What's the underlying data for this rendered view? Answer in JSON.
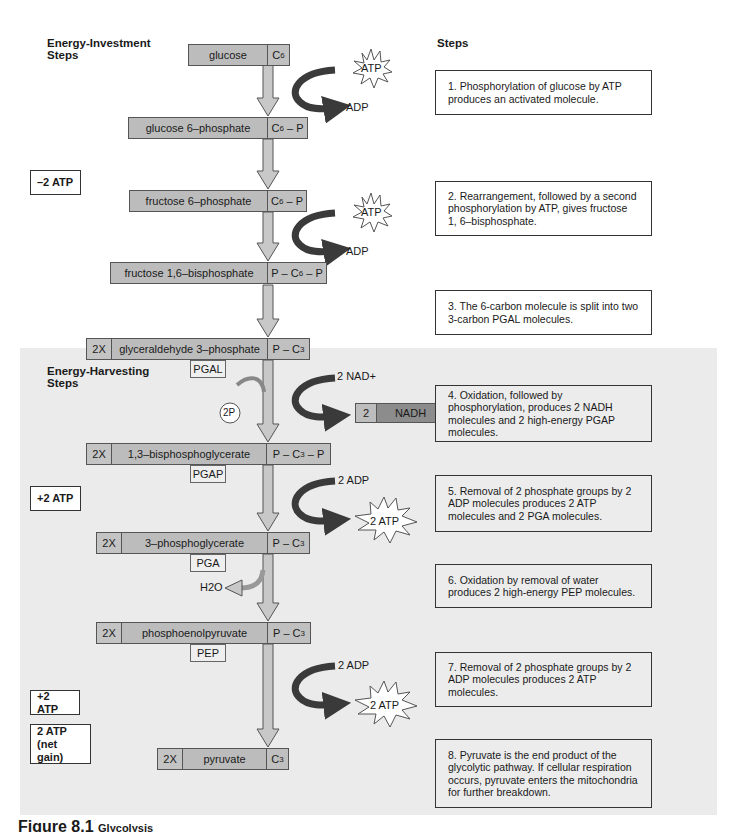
{
  "sections": {
    "investment_title": "Energy-Investment Steps",
    "harvesting_title": "Energy-Harvesting Steps",
    "steps_header": "Steps"
  },
  "atp_tallies": [
    {
      "label": "–2 ATP"
    },
    {
      "label": "+2 ATP"
    },
    {
      "label": "+2 ATP"
    },
    {
      "label": "2 ATP",
      "sub": "(net gain)"
    }
  ],
  "molecules": [
    {
      "name": "glucose",
      "formula": "C6",
      "multiplier": ""
    },
    {
      "name": "glucose 6–phosphate",
      "formula": "C6 – P",
      "multiplier": ""
    },
    {
      "name": "fructose 6–phosphate",
      "formula": "C6 – P",
      "multiplier": ""
    },
    {
      "name": "fructose 1,6–bisphosphate",
      "formula": "P – C6 – P",
      "multiplier": ""
    },
    {
      "name": "glyceraldehyde 3–phosphate",
      "formula": "P – C3",
      "multiplier": "2X",
      "abbr": "PGAL"
    },
    {
      "name": "1,3–bisphosphoglycerate",
      "formula": "P – C3 – P",
      "multiplier": "2X",
      "abbr": "PGAP"
    },
    {
      "name": "3–phosphoglycerate",
      "formula": "P – C3",
      "multiplier": "2X",
      "abbr": "PGA"
    },
    {
      "name": "phosphoenolpyruvate",
      "formula": "P – C3",
      "multiplier": "2X",
      "abbr": "PEP"
    },
    {
      "name": "pyruvate",
      "formula": "C3",
      "multiplier": "2X"
    }
  ],
  "side_labels": {
    "atp_in_1": "ATP",
    "adp_out_1": "ADP",
    "atp_in_2": "ATP",
    "adp_out_2": "ADP",
    "nad_in": "2 NAD+",
    "nadh_count": "2",
    "nadh_label": "NADH",
    "phosphate_in": "2P",
    "adp_in_1": "2 ADP",
    "atp_out_1": "2 ATP",
    "water_out": "H2O",
    "adp_in_2": "2 ADP",
    "atp_out_2": "2 ATP"
  },
  "steps": [
    {
      "text": "1.  Phosphorylation of glucose by ATP produces an activated molecule."
    },
    {
      "text": "2.  Rearrangement, followed by a second phosphorylation by ATP, gives fructose 1, 6–bisphosphate."
    },
    {
      "text": "3.  The 6-carbon molecule is split into two 3-carbon PGAL molecules."
    },
    {
      "text": "4.  Oxidation, followed by phosphorylation, produces 2 NADH molecules and 2 high-energy PGAP molecules."
    },
    {
      "text": "5.  Removal of 2 phosphate groups by 2 ADP molecules produces 2 ATP molecules and 2 PGA molecules."
    },
    {
      "text": "6.  Oxidation by removal of water produces 2 high-energy PEP molecules."
    },
    {
      "text": "7.  Removal of 2 phosphate groups by 2 ADP molecules produces 2 ATP molecules."
    },
    {
      "text": "8. Pyruvate is the end product of the glycolytic pathway. If cellular respiration occurs, pyruvate enters the mitochondria for further breakdown."
    }
  ],
  "caption": {
    "figure": "Figure 8.1",
    "title": "Glycolysis"
  },
  "colors": {
    "box_fill": "#bcbcbc",
    "nadh_fill": "#8c8c8c",
    "arrow_fill": "#c8c8c8",
    "curved_arrow": "#3a3a3a",
    "harvest_bg": "#ebebeb",
    "caption": "#1a1a1a"
  }
}
